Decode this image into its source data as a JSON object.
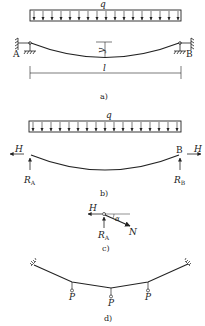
{
  "panels": {
    "a": {
      "caption": "a)",
      "load_label": "q",
      "support_left": "A",
      "support_right": "B",
      "sag_label": "y",
      "span_label": "l"
    },
    "b": {
      "caption": "b)",
      "load_label": "q",
      "horizontal_force_left": "H",
      "horizontal_force_right": "H",
      "support_right": "B",
      "reaction_left": "R",
      "reaction_left_sub": "A",
      "reaction_right": "R",
      "reaction_right_sub": "B"
    },
    "c": {
      "caption": "c)",
      "horizontal_force": "H",
      "angle": "α",
      "tension": "N",
      "reaction": "R",
      "reaction_sub": "A"
    },
    "d": {
      "caption": "d)",
      "point_loads": [
        "P",
        "P",
        "P"
      ]
    }
  },
  "colors": {
    "stroke": "#222222",
    "background": "#ffffff"
  }
}
